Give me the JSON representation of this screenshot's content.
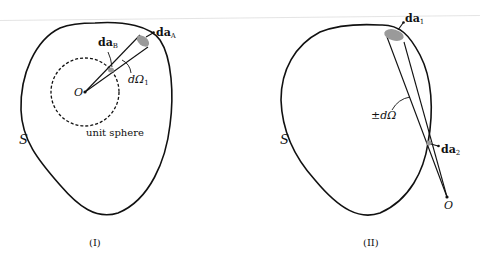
{
  "figure_I": {
    "caption": "(I)",
    "surface_label": "S",
    "origin_label": "O",
    "sphere_label": "unit sphere",
    "patch_A_label": "da",
    "patch_A_sub": "A",
    "patch_B_label": "da",
    "patch_B_sub": "B",
    "solid_angle_label": "dΩ",
    "solid_angle_sub": "1"
  },
  "figure_II": {
    "caption": "(II)",
    "surface_label": "S",
    "origin_label": "O",
    "patch_1_label": "da",
    "patch_1_sub": "1",
    "patch_2_label": "da",
    "patch_2_sub": "2",
    "solid_angle_label": "±dΩ"
  },
  "colors": {
    "stroke": "#111111",
    "patch_fill": "#9a9a9a",
    "background": "#ffffff"
  }
}
